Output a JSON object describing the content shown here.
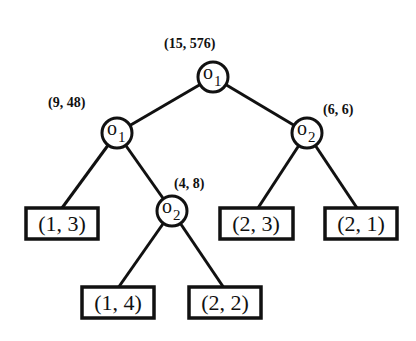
{
  "diagram": {
    "type": "binary-tree",
    "nodes": {
      "root": {
        "op": "o",
        "sub": "1",
        "label": "(15, 576)"
      },
      "left": {
        "op": "o",
        "sub": "1",
        "label": "(9, 48)"
      },
      "right": {
        "op": "o",
        "sub": "2",
        "label": "(6, 6)"
      },
      "leftright": {
        "op": "o",
        "sub": "2",
        "label": "(4, 8)"
      }
    },
    "leaves": {
      "l1": "(1, 3)",
      "l2": "(1, 4)",
      "l3": "(2, 2)",
      "l4": "(2, 3)",
      "l5": "(2, 1)"
    }
  }
}
